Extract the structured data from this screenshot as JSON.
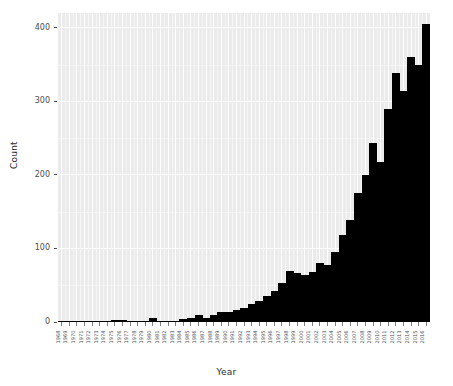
{
  "chart_data": {
    "type": "bar",
    "title": "",
    "subtitle": "",
    "xlabel": "Year",
    "ylabel": "Count",
    "xlim": [
      "1968",
      "2016"
    ],
    "ylim": [
      0,
      420
    ],
    "y_ticks": [
      0,
      100,
      200,
      300,
      400
    ],
    "y_tick_labels": [
      "0",
      "100",
      "200",
      "300",
      "400"
    ],
    "grid": true,
    "legend": "none",
    "bar_color": "#000000",
    "panel_color": "#ebebeb",
    "gridline_color": "#ffffff",
    "categories": [
      "1968",
      "1969",
      "1970",
      "1971",
      "1972",
      "1973",
      "1974",
      "1975",
      "1976",
      "1977",
      "1978",
      "1979",
      "1980",
      "1981",
      "1982",
      "1983",
      "1984",
      "1985",
      "1986",
      "1987",
      "1988",
      "1989",
      "1990",
      "1991",
      "1992",
      "1993",
      "1994",
      "1995",
      "1996",
      "1997",
      "1998",
      "1999",
      "2000",
      "2001",
      "2002",
      "2003",
      "2004",
      "2005",
      "2006",
      "2007",
      "2008",
      "2009",
      "2010",
      "2011",
      "2012",
      "2013",
      "2014",
      "2015",
      "2016"
    ],
    "values": [
      1,
      2,
      0,
      0,
      0,
      0,
      2,
      3,
      3,
      2,
      2,
      2,
      5,
      1,
      1,
      2,
      4,
      6,
      9,
      6,
      10,
      13,
      14,
      16,
      19,
      24,
      29,
      35,
      42,
      53,
      70,
      66,
      64,
      68,
      80,
      77,
      95,
      118,
      139,
      176,
      200,
      244,
      217,
      290,
      338,
      314,
      360,
      350,
      405
    ],
    "peak": {
      "year": "2014",
      "value": 405
    }
  },
  "axes": {
    "y_title": "Count",
    "x_title": "Year"
  }
}
